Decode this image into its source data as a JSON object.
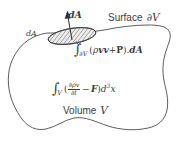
{
  "figure": {
    "domain": "Diagram",
    "background_color": "#ffffff",
    "ink_color": "#3c3c3c",
    "width": 187,
    "height": 150
  },
  "labels": {
    "normal_vector": "dA",
    "area_patch": "dA",
    "surface_text": "Surface",
    "surface_symbol": "∂V",
    "volume_text": "Volume",
    "volume_symbol": "V"
  },
  "equations": {
    "surface_integral": {
      "integral_symbol": "∫",
      "subscript": "∂V",
      "open_paren": "(",
      "rho": "ρ",
      "vv": "vv",
      "plus": "+",
      "P": "P",
      "close_paren": ")",
      "dot": ".",
      "dA": "dA",
      "plain": "∫∂V(ρvv+P).dA"
    },
    "volume_integral": {
      "integral_symbol": "∫",
      "subscript": "V",
      "open_paren": "(",
      "numerator": "∂ρv",
      "denominator": "∂t",
      "minus": "−",
      "F": "F",
      "close_paren": ")",
      "d": "d",
      "exponent": "3",
      "x": "x",
      "plain": "∫V(∂ρv/∂t − F)d³x"
    }
  },
  "geometry": {
    "blob_stroke": "#4a4a4a",
    "blob_stroke_width": 0.9,
    "blob_fill": "none",
    "patch_fill": "#e8e8e8",
    "patch_stroke": "#3c3c3c",
    "hatch_color": "#5a5a5a",
    "arrow_color": "#2e2e2e",
    "patch_center_x": 72,
    "patch_center_y": 36,
    "patch_rx": 24,
    "patch_ry": 7.5,
    "patch_rotation_deg": -9,
    "arrow_tip_x": 67,
    "arrow_tip_y": 12,
    "arrow_base_x": 72,
    "arrow_base_y": 40
  }
}
